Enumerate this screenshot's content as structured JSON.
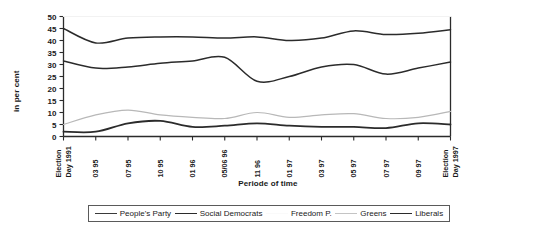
{
  "chart_data": {
    "type": "line",
    "title": "",
    "xlabel": "Periode of time",
    "ylabel": "in per cent",
    "ylim": [
      0,
      50
    ],
    "ytick_step": 5,
    "yticks": [
      0,
      5,
      10,
      15,
      20,
      25,
      30,
      35,
      40,
      45,
      50
    ],
    "grid": false,
    "legend_position": "bottom",
    "categories": [
      "Election Day 1991",
      "03 95",
      "07 95",
      "10 95",
      "01 96",
      "05/06 96",
      "11 96",
      "01 97",
      "03 97",
      "05 97",
      "07 97",
      "09 97",
      "Election Day 1997"
    ],
    "series": [
      {
        "name": "People's Party",
        "color": "#2b2b2b",
        "width": 1.5,
        "values": [
          45,
          39,
          41,
          41.5,
          41.5,
          41,
          41.5,
          40,
          41,
          44,
          42.5,
          43,
          44.5
        ]
      },
      {
        "name": "Social Democrats",
        "color": "#2b2b2b",
        "width": 1.5,
        "values": [
          31.5,
          28.5,
          29,
          30.5,
          31.5,
          33,
          23,
          25,
          29,
          30,
          26,
          28.5,
          31
        ]
      },
      {
        "name": "Freedom P.",
        "color": "#f2f2f2",
        "width": 1.2,
        "values": [
          50,
          50,
          50,
          50,
          50,
          50,
          50,
          50,
          50,
          50,
          50,
          50,
          50
        ]
      },
      {
        "name": "Greens",
        "color": "#b8b8b8",
        "width": 1.2,
        "values": [
          5,
          9,
          11,
          9,
          8,
          7.5,
          10,
          8,
          9,
          9.5,
          7.5,
          8,
          10.5
        ]
      },
      {
        "name": "Liberals",
        "color": "#2b2b2b",
        "width": 1.8,
        "values": [
          2,
          2,
          5.5,
          6.5,
          4,
          4.5,
          5.5,
          4.5,
          4,
          4,
          3.5,
          5.5,
          5
        ]
      }
    ]
  },
  "legend": {
    "entries": [
      {
        "label": "People's Party",
        "color": "#3a3a3a"
      },
      {
        "label": "Social Democrats",
        "color": "#2b2b2b"
      },
      {
        "label": "Freedom P.",
        "color": "#fafafa"
      },
      {
        "label": "Greens",
        "color": "#c4c4c4"
      },
      {
        "label": "Liberals",
        "color": "#2b2b2b"
      }
    ]
  }
}
